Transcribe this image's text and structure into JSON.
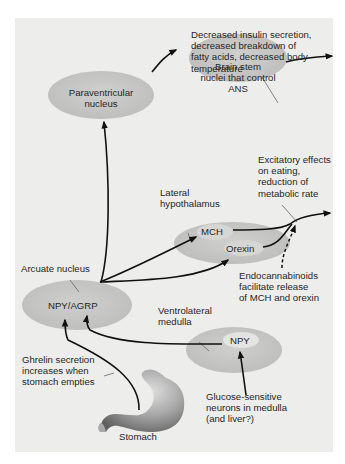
{
  "diagram": {
    "title": "",
    "colors": {
      "background": "#ededeb",
      "ellipse": "#c6c6c4",
      "ellipse_highlight": "#e6e6e4",
      "arrow": "#111111",
      "stomach": "#8f8f8f"
    },
    "nodes": {
      "paraventricular": {
        "line1": "Paraventricular",
        "line2": "nucleus"
      },
      "brainstem": {
        "line1": "Brain stem",
        "line2": "nuclei that control",
        "line3": "ANS"
      },
      "lateral_hypothalamus": {
        "label1": "Lateral",
        "label2": "hypothalamus",
        "mch": "MCH",
        "orexin": "Orexin"
      },
      "arcuate": {
        "label": "Arcuate nucleus",
        "inner": "NPY/AGRP"
      },
      "ventrolateral_medulla": {
        "label1": "Ventrolateral",
        "label2": "medulla",
        "inner": "NPY"
      },
      "stomach": {
        "label": "Stomach"
      }
    },
    "annotations": {
      "brainstem_output": {
        "line1": "Decreased insulin secretion,",
        "line2": "decreased breakdown of",
        "line3": "fatty acids, decreased body",
        "line4": "temperature"
      },
      "hypothalamus_output": {
        "line1": "Excitatory effects",
        "line2": "on eating,",
        "line3": "reduction of",
        "line4": "metabolic rate"
      },
      "endocannabinoids": {
        "line1": "Endocannabinoids",
        "line2": "facilitate release",
        "line3": "of MCH and orexin"
      },
      "ghrelin": {
        "line1": "Ghrelin secretion",
        "line2": "increases when",
        "line3": "stomach empties"
      },
      "glucose": {
        "line1": "Glucose-sensitive",
        "line2": "neurons in medulla",
        "line3": "(and liver?)"
      }
    },
    "edges": [
      {
        "from": "Stomach (ghrelin)",
        "to": "NPY/AGRP",
        "style": "solid"
      },
      {
        "from": "NPY (ventrolateral medulla)",
        "to": "NPY/AGRP",
        "style": "solid"
      },
      {
        "from": "Glucose-sensitive neurons",
        "to": "NPY (ventrolateral medulla)",
        "style": "solid"
      },
      {
        "from": "NPY/AGRP",
        "to": "Paraventricular nucleus",
        "style": "solid"
      },
      {
        "from": "NPY/AGRP",
        "to": "MCH",
        "style": "solid"
      },
      {
        "from": "NPY/AGRP",
        "to": "Orexin",
        "style": "solid"
      },
      {
        "from": "Paraventricular nucleus",
        "to": "Brain stem nuclei that control ANS",
        "style": "solid"
      },
      {
        "from": "Brain stem nuclei that control ANS",
        "to": "Decreased insulin secretion...",
        "style": "solid"
      },
      {
        "from": "MCH + Orexin",
        "to": "Excitatory effects on eating, reduction of metabolic rate",
        "style": "solid"
      },
      {
        "from": "Endocannabinoids",
        "to": "MCH/Orexin output",
        "style": "dashed"
      }
    ]
  }
}
